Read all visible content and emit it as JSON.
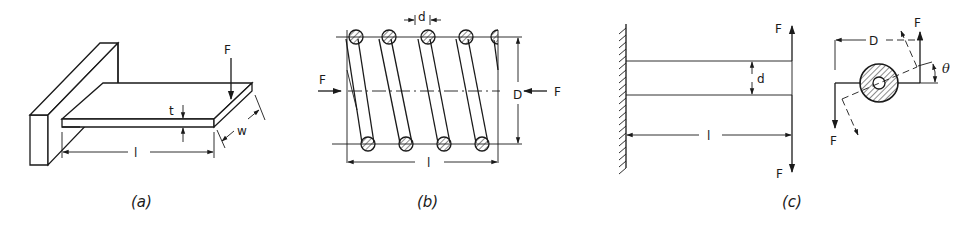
{
  "figure": {
    "panels": [
      {
        "id": "a",
        "caption": "(a)",
        "description": "cantilever flat plate spring",
        "labels": {
          "force": "F",
          "thickness": "t",
          "width": "w",
          "length": "l"
        }
      },
      {
        "id": "b",
        "caption": "(b)",
        "description": "helical compression spring",
        "labels": {
          "force_left": "F",
          "force_right": "F",
          "wire_diameter": "d",
          "coil_diameter": "D",
          "length": "l"
        },
        "visible_coils_top": 5,
        "visible_coils_bottom": 4
      },
      {
        "id": "c",
        "caption": "(c)",
        "description": "torsion bar with lever arms",
        "labels": {
          "force_top": "F",
          "force_bottom": "F",
          "diameter": "d",
          "length": "l",
          "arm": "D",
          "angle": "θ",
          "end_force_top": "F",
          "end_force_bottom": "F"
        }
      }
    ]
  }
}
